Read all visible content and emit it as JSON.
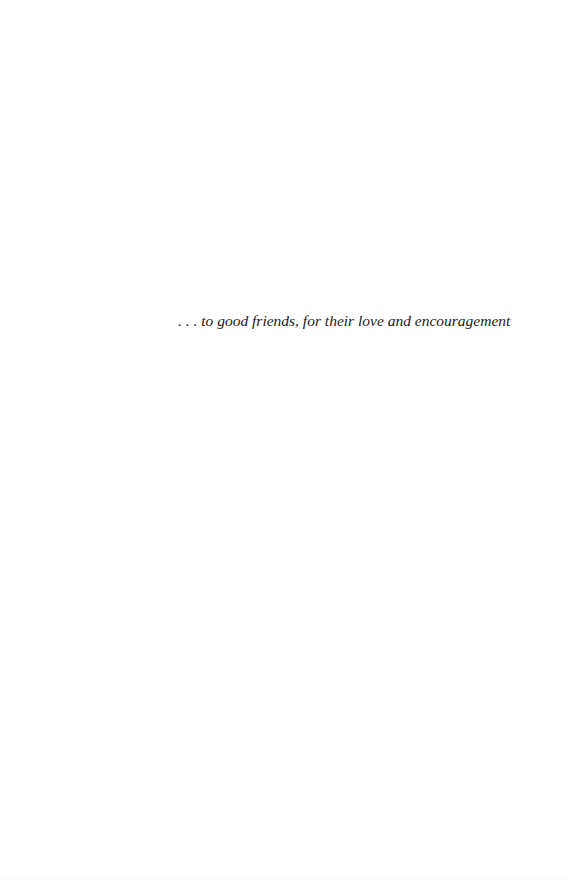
{
  "page": {
    "type": "dedication",
    "background_color": "#ffffff",
    "text_color": "#1a1a1a"
  },
  "dedication": {
    "text": ". . . to good friends, for their love and encouragement"
  }
}
